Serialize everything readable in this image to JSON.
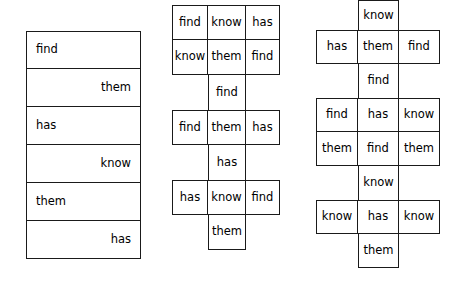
{
  "page": {
    "words": [
      "find",
      "know",
      "has",
      "them"
    ],
    "background_color": "#ffffff",
    "line_color": "#1a1a1a",
    "text_color": "#000000"
  },
  "groups": [
    {
      "name": "left-word-box-column",
      "kind": "single-column-alternating",
      "rows": [
        {
          "text": "find",
          "align": "left"
        },
        {
          "text": "them",
          "align": "right"
        },
        {
          "text": "has",
          "align": "left"
        },
        {
          "text": "know",
          "align": "right"
        },
        {
          "text": "them",
          "align": "left"
        },
        {
          "text": "has",
          "align": "right"
        }
      ]
    },
    {
      "name": "middle-crossword-grid",
      "kind": "cross-grid",
      "spine_column": "center",
      "rows": [
        {
          "type": "full",
          "cells": [
            "find",
            "know",
            "has"
          ]
        },
        {
          "type": "full",
          "cells": [
            "know",
            "them",
            "find"
          ]
        },
        {
          "type": "spine",
          "cells": [
            "",
            "find",
            ""
          ]
        },
        {
          "type": "full",
          "cells": [
            "find",
            "them",
            "has"
          ]
        },
        {
          "type": "spine",
          "cells": [
            "",
            "has",
            ""
          ]
        },
        {
          "type": "full",
          "cells": [
            "has",
            "know",
            "find"
          ]
        },
        {
          "type": "spine",
          "cells": [
            "",
            "them",
            ""
          ]
        }
      ]
    },
    {
      "name": "right-crossword-grid",
      "kind": "cross-grid",
      "spine_column": "center",
      "rows": [
        {
          "type": "spine",
          "cells": [
            "",
            "know",
            ""
          ]
        },
        {
          "type": "full",
          "cells": [
            "has",
            "them",
            "find"
          ]
        },
        {
          "type": "spine",
          "cells": [
            "",
            "find",
            ""
          ]
        },
        {
          "type": "full",
          "cells": [
            "find",
            "has",
            "know"
          ]
        },
        {
          "type": "full",
          "cells": [
            "them",
            "find",
            "them"
          ]
        },
        {
          "type": "spine",
          "cells": [
            "",
            "know",
            ""
          ]
        },
        {
          "type": "full",
          "cells": [
            "know",
            "has",
            "know"
          ]
        },
        {
          "type": "spine",
          "cells": [
            "",
            "them",
            ""
          ]
        }
      ]
    }
  ]
}
